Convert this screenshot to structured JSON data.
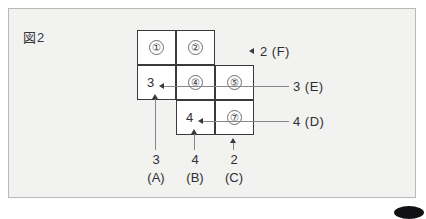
{
  "figure": {
    "title": "図2",
    "grid": {
      "cells": [
        {
          "id": "cell-r1c1",
          "circled": "①",
          "row": 1,
          "col": 1
        },
        {
          "id": "cell-r1c2",
          "circled": "②",
          "row": 1,
          "col": 2
        },
        {
          "id": "cell-r2c1",
          "value": "3",
          "row": 2,
          "col": 1
        },
        {
          "id": "cell-r2c2",
          "circled": "④",
          "row": 2,
          "col": 2
        },
        {
          "id": "cell-r2c3",
          "circled": "⑤",
          "row": 2,
          "col": 3
        },
        {
          "id": "cell-r3c2",
          "value": "4",
          "row": 3,
          "col": 2
        },
        {
          "id": "cell-r3c3",
          "circled": "⑦",
          "row": 3,
          "col": 3
        }
      ]
    },
    "right_labels": [
      {
        "id": "label-f",
        "text": "2 (F)"
      },
      {
        "id": "label-e",
        "text": "3 (E)"
      },
      {
        "id": "label-d",
        "text": "4 (D)"
      }
    ],
    "bottom_labels": [
      {
        "id": "label-a",
        "number": "3",
        "letter": "(A)"
      },
      {
        "id": "label-b",
        "number": "4",
        "letter": "(B)"
      },
      {
        "id": "label-c",
        "number": "2",
        "letter": "(C)"
      }
    ],
    "colors": {
      "background": "#f2f2f1",
      "frame_border": "#b9b9b7",
      "cell_border": "#3a3a3c",
      "leader_line": "#86868a",
      "text": "#2e2e30"
    }
  }
}
